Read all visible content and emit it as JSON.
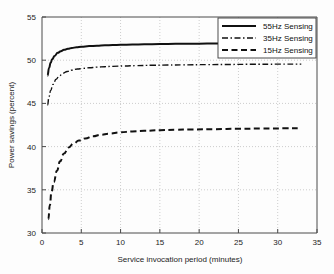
{
  "chart_data": {
    "type": "line",
    "title": "",
    "xlabel": "Service invocation period (minutes)",
    "ylabel": "Power savings (percent)",
    "xlim": [
      0,
      35
    ],
    "ylim": [
      30,
      55
    ],
    "xticks": [
      0,
      5,
      10,
      15,
      20,
      25,
      30,
      35
    ],
    "yticks": [
      30,
      35,
      40,
      45,
      50,
      55
    ],
    "xtick_labels": [
      "0",
      "5",
      "10",
      "15",
      "20",
      "25",
      "30",
      "35"
    ],
    "ytick_labels": [
      "30",
      "35",
      "40",
      "45",
      "50",
      "55"
    ],
    "grid": true,
    "grid_style": "dotted",
    "legend_position": "top-right",
    "series": [
      {
        "name": "55Hz Sensing",
        "style": "solid",
        "color": "#111111",
        "x": [
          0.7,
          0.9,
          1.1,
          1.3,
          1.6,
          2.0,
          2.4,
          2.8,
          3.3,
          3.8,
          4.4,
          5.0,
          6.0,
          7.0,
          8.0,
          9.0,
          10.0,
          11.5,
          13.0,
          15.0,
          17.0,
          19.0,
          21.0,
          23.0
        ],
        "y": [
          48.2,
          49.1,
          49.7,
          50.1,
          50.5,
          50.85,
          51.05,
          51.2,
          51.32,
          51.42,
          51.5,
          51.55,
          51.63,
          51.68,
          51.72,
          51.75,
          51.78,
          51.81,
          51.84,
          51.87,
          51.89,
          51.91,
          51.92,
          51.93
        ]
      },
      {
        "name": "35Hz Sensing",
        "style": "dashdot",
        "color": "#555555",
        "x": [
          0.7,
          0.9,
          1.1,
          1.4,
          1.8,
          2.2,
          2.7,
          3.2,
          3.8,
          4.5,
          5.2,
          6.0,
          7.0,
          8.0,
          9.0,
          10.5,
          12.0,
          14.0,
          16.0,
          18.0,
          21.0,
          24.0,
          27.0,
          30.0,
          33.0
        ],
        "y": [
          44.8,
          45.8,
          46.5,
          47.2,
          47.8,
          48.2,
          48.5,
          48.7,
          48.85,
          48.98,
          49.05,
          49.12,
          49.2,
          49.25,
          49.29,
          49.33,
          49.37,
          49.41,
          49.44,
          49.46,
          49.49,
          49.51,
          49.53,
          49.54,
          49.55
        ]
      },
      {
        "name": "15Hz Sensing",
        "style": "dashed",
        "color": "#111111",
        "x": [
          0.8,
          1.0,
          1.2,
          1.5,
          1.9,
          2.3,
          2.8,
          3.4,
          4.0,
          4.7,
          5.5,
          6.5,
          7.5,
          8.5,
          10.0,
          11.5,
          13.0,
          15.0,
          17.0,
          19.0,
          22.0,
          25.0,
          28.0,
          31.0,
          33.0
        ],
        "y": [
          31.6,
          33.2,
          34.7,
          35.9,
          37.2,
          38.3,
          39.2,
          39.9,
          40.35,
          40.7,
          40.95,
          41.2,
          41.38,
          41.5,
          41.65,
          41.76,
          41.83,
          41.9,
          41.95,
          41.98,
          42.02,
          42.06,
          42.09,
          42.11,
          42.13
        ]
      }
    ]
  },
  "legend": {
    "entries": [
      {
        "label": "55Hz Sensing"
      },
      {
        "label": "35Hz Sensing"
      },
      {
        "label": "15Hz Sensing"
      }
    ]
  }
}
